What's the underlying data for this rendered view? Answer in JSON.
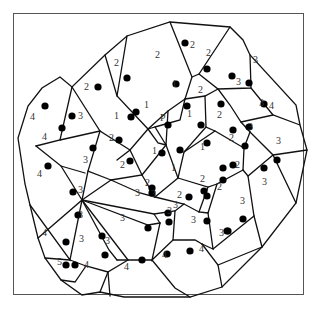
{
  "diagram": {
    "type": "voronoi",
    "frame": {
      "x": 13,
      "y": 13,
      "w": 291,
      "h": 282
    },
    "colors": {
      "edge": "#111111",
      "site": "#000000",
      "label": "#333333",
      "frame": "#555555"
    },
    "special_label": "P",
    "edges": [
      "M105,55 L127,36 L170,22 L230,27 L243,40 L250,55 L296,105 L300,125 L307,150 L296,203 L262,247 L222,287 L190,297 L155,297 L124,297 L100,292 L82,295 L61,280 L45,258 L38,238 L30,205 L25,184 L18,138 L28,106 L42,88 L60,77 L72,87 L105,55",
      "M72,87 L60,140 L36,146",
      "M105,55 L117,96 L148,129 L168,111 L185,99",
      "M127,36 L117,96",
      "M170,22 L192,77 L185,99",
      "M230,27 L199,74 L192,77",
      "M199,74 L218,89 L251,88 L250,55",
      "M218,89 L230,105 L241,122 L250,132",
      "M251,88 L273,115",
      "M241,122 L273,115 L300,125",
      "M185,99 L205,96 L218,89",
      "M205,96 L206,127 L215,131",
      "M185,99 L180,120 L155,127",
      "M148,129 L155,127 L166,145 L168,111",
      "M148,129 L158,143 L166,145",
      "M72,87 L100,131 L130,150 L117,160",
      "M60,140 L100,131",
      "M36,146 L61,166 L85,173",
      "M100,131 L88,171 L111,180",
      "M61,166 L82,200 L38,238",
      "M88,171 L82,200",
      "M130,150 L148,129",
      "M130,150 L142,175 L111,180",
      "M142,175 L166,145",
      "M142,175 L155,197 L178,178 L166,145",
      "M178,178 L184,152 L206,127",
      "M184,152 L215,131 L244,148 L243,170",
      "M250,132 L244,148",
      "M250,132 L273,155 L296,203",
      "M273,155 L307,150",
      "M273,155 L248,176 L243,170",
      "M248,176 L254,216 L262,247",
      "M243,170 L217,184 L208,213",
      "M178,178 L208,187 L217,184",
      "M208,187 L199,212 L208,213",
      "M155,197 L184,204 L199,212",
      "M111,180 L140,193 L155,197",
      "M82,200 L111,180",
      "M82,200 L154,214 L175,211 L184,204",
      "M82,200 L70,260 L30,205",
      "M82,200 L128,260",
      "M82,200 L109,250 L117,260",
      "M82,200 L148,225 L160,223",
      "M154,214 L160,223",
      "M175,211 L173,240 L195,240 L202,244",
      "M208,213 L213,249 L202,244",
      "M213,249 L254,216",
      "M160,223 L152,260 L173,240",
      "M152,260 L128,260 L117,260",
      "M128,260 L108,272 L100,292",
      "M70,260 L86,266 L108,272",
      "M70,260 L45,258",
      "M86,266 L75,282 L61,280",
      "M152,260 L175,288 L190,297",
      "M202,244 L218,265 L222,287",
      "M218,265 L262,247",
      "M108,272 L110,296"
    ],
    "sites": [
      {
        "x": 45,
        "y": 106
      },
      {
        "x": 72,
        "y": 116
      },
      {
        "x": 98,
        "y": 87
      },
      {
        "x": 127,
        "y": 78
      },
      {
        "x": 185,
        "y": 43
      },
      {
        "x": 207,
        "y": 69
      },
      {
        "x": 176,
        "y": 84
      },
      {
        "x": 136,
        "y": 112
      },
      {
        "x": 131,
        "y": 117
      },
      {
        "x": 119,
        "y": 140
      },
      {
        "x": 62,
        "y": 128
      },
      {
        "x": 93,
        "y": 148
      },
      {
        "x": 48,
        "y": 166
      },
      {
        "x": 73,
        "y": 192
      },
      {
        "x": 78,
        "y": 215
      },
      {
        "x": 66,
        "y": 242
      },
      {
        "x": 102,
        "y": 236
      },
      {
        "x": 66,
        "y": 265
      },
      {
        "x": 75,
        "y": 265
      },
      {
        "x": 130,
        "y": 161
      },
      {
        "x": 168,
        "y": 125
      },
      {
        "x": 201,
        "y": 125
      },
      {
        "x": 162,
        "y": 153
      },
      {
        "x": 180,
        "y": 150
      },
      {
        "x": 207,
        "y": 143
      },
      {
        "x": 233,
        "y": 130
      },
      {
        "x": 223,
        "y": 168
      },
      {
        "x": 233,
        "y": 165
      },
      {
        "x": 232,
        "y": 76
      },
      {
        "x": 249,
        "y": 83
      },
      {
        "x": 264,
        "y": 104
      },
      {
        "x": 249,
        "y": 127
      },
      {
        "x": 245,
        "y": 146
      },
      {
        "x": 277,
        "y": 160
      },
      {
        "x": 187,
        "y": 106
      },
      {
        "x": 221,
        "y": 104
      },
      {
        "x": 152,
        "y": 188
      },
      {
        "x": 152,
        "y": 193
      },
      {
        "x": 189,
        "y": 197
      },
      {
        "x": 204,
        "y": 191
      },
      {
        "x": 207,
        "y": 196
      },
      {
        "x": 148,
        "y": 228
      },
      {
        "x": 168,
        "y": 213
      },
      {
        "x": 169,
        "y": 222
      },
      {
        "x": 207,
        "y": 221
      },
      {
        "x": 243,
        "y": 219
      },
      {
        "x": 228,
        "y": 231
      },
      {
        "x": 223,
        "y": 180
      },
      {
        "x": 142,
        "y": 260
      },
      {
        "x": 167,
        "y": 254
      },
      {
        "x": 190,
        "y": 251
      },
      {
        "x": 227,
        "y": 231
      },
      {
        "x": 105,
        "y": 255
      },
      {
        "x": 264,
        "y": 168
      }
    ],
    "labels": [
      {
        "text": "4",
        "x": 30,
        "y": 120
      },
      {
        "text": "3",
        "x": 78,
        "y": 119
      },
      {
        "text": "2",
        "x": 84,
        "y": 90
      },
      {
        "text": "2",
        "x": 114,
        "y": 66
      },
      {
        "text": "2",
        "x": 155,
        "y": 58
      },
      {
        "text": "2",
        "x": 190,
        "y": 48
      },
      {
        "text": "2",
        "x": 206,
        "y": 56
      },
      {
        "text": "1",
        "x": 172,
        "y": 87
      },
      {
        "text": "2",
        "x": 198,
        "y": 93
      },
      {
        "text": "1",
        "x": 114,
        "y": 119
      },
      {
        "text": "1",
        "x": 144,
        "y": 108
      },
      {
        "text": "2",
        "x": 109,
        "y": 141
      },
      {
        "text": "P",
        "x": 160,
        "y": 121
      },
      {
        "text": "1",
        "x": 187,
        "y": 117
      },
      {
        "text": "2",
        "x": 217,
        "y": 118
      },
      {
        "text": "4",
        "x": 42,
        "y": 140
      },
      {
        "text": "4",
        "x": 37,
        "y": 177
      },
      {
        "text": "3",
        "x": 83,
        "y": 163
      },
      {
        "text": "3",
        "x": 78,
        "y": 193
      },
      {
        "text": "2",
        "x": 120,
        "y": 168
      },
      {
        "text": "1",
        "x": 152,
        "y": 154
      },
      {
        "text": "1",
        "x": 171,
        "y": 171
      },
      {
        "text": "1",
        "x": 200,
        "y": 150
      },
      {
        "text": "2",
        "x": 229,
        "y": 141
      },
      {
        "text": "2",
        "x": 235,
        "y": 168
      },
      {
        "text": "3",
        "x": 259,
        "y": 106
      },
      {
        "text": "3",
        "x": 236,
        "y": 85
      },
      {
        "text": "3",
        "x": 253,
        "y": 63
      },
      {
        "text": "4",
        "x": 269,
        "y": 109
      },
      {
        "text": "3",
        "x": 248,
        "y": 130
      },
      {
        "text": "3",
        "x": 276,
        "y": 144
      },
      {
        "text": "3",
        "x": 262,
        "y": 185
      },
      {
        "text": "3",
        "x": 78,
        "y": 218
      },
      {
        "text": "3",
        "x": 79,
        "y": 242
      },
      {
        "text": "4",
        "x": 42,
        "y": 236
      },
      {
        "text": "5",
        "x": 57,
        "y": 265
      },
      {
        "text": "4",
        "x": 84,
        "y": 268
      },
      {
        "text": "3",
        "x": 105,
        "y": 244
      },
      {
        "text": "3",
        "x": 120,
        "y": 221
      },
      {
        "text": "3",
        "x": 135,
        "y": 196
      },
      {
        "text": "2",
        "x": 145,
        "y": 186
      },
      {
        "text": "3",
        "x": 151,
        "y": 197
      },
      {
        "text": "3",
        "x": 167,
        "y": 214
      },
      {
        "text": "3",
        "x": 173,
        "y": 208
      },
      {
        "text": "2",
        "x": 177,
        "y": 198
      },
      {
        "text": "2",
        "x": 200,
        "y": 182
      },
      {
        "text": "2",
        "x": 217,
        "y": 190
      },
      {
        "text": "3",
        "x": 191,
        "y": 223
      },
      {
        "text": "3",
        "x": 240,
        "y": 204
      },
      {
        "text": "3",
        "x": 219,
        "y": 236
      },
      {
        "text": "4",
        "x": 162,
        "y": 258
      },
      {
        "text": "4",
        "x": 199,
        "y": 252
      },
      {
        "text": "4",
        "x": 124,
        "y": 270
      }
    ]
  }
}
